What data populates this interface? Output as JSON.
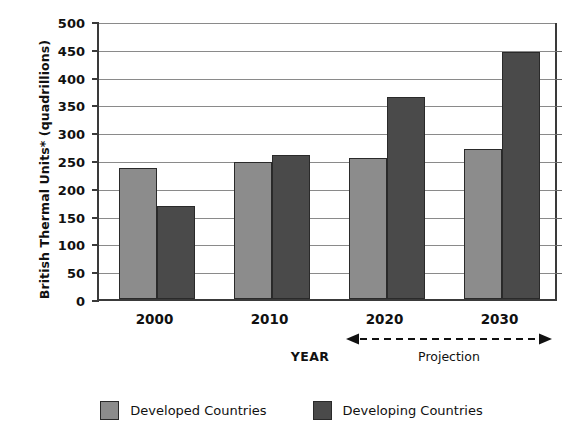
{
  "chart_data": {
    "type": "bar",
    "title": "",
    "xlabel": "YEAR",
    "ylabel": "British Thermal Units* (quadrillions)",
    "categories": [
      "2000",
      "2010",
      "2020",
      "2030"
    ],
    "series": [
      {
        "name": "Developed Countries",
        "color": "#8c8c8c",
        "values": [
          235,
          246,
          254,
          270
        ]
      },
      {
        "name": "Developing Countries",
        "color": "#4a4a4a",
        "values": [
          168,
          259,
          363,
          444
        ]
      }
    ],
    "ylim": [
      0,
      500
    ],
    "ytick_values": [
      0,
      50,
      100,
      150,
      200,
      250,
      300,
      350,
      400,
      450,
      500
    ],
    "ytick_labels": [
      "0",
      "50",
      "100",
      "150",
      "200",
      "250",
      "300",
      "350",
      "400",
      "450",
      "500"
    ],
    "grid": true,
    "legend_position": "bottom",
    "annotations": [
      {
        "name": "projection-span",
        "label": "Projection",
        "from": "2020",
        "to": "2030",
        "style": "dashed double-headed arrow"
      }
    ]
  },
  "legend": {
    "items": [
      {
        "label": "Developed Countries",
        "color": "#8c8c8c"
      },
      {
        "label": "Developing Countries",
        "color": "#4a4a4a"
      }
    ]
  },
  "axes": {
    "y_title": "British Thermal Units* (quadrillions)",
    "x_title": "YEAR"
  },
  "projection": {
    "label": "Projection"
  }
}
